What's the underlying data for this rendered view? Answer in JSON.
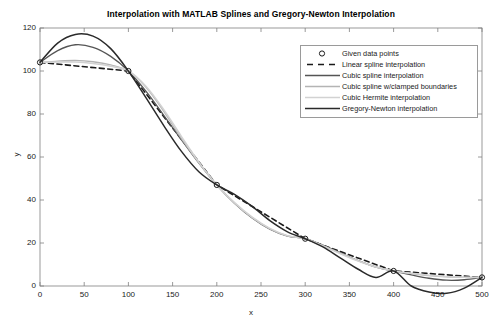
{
  "chart_data": {
    "type": "line",
    "title": "Interpolation with MATLAB Splines and Gregory-Newton Interpolation",
    "xlabel": "x",
    "ylabel": "y",
    "xlim": [
      0,
      500
    ],
    "ylim": [
      0,
      120
    ],
    "xticks": [
      0,
      50,
      100,
      150,
      200,
      250,
      300,
      350,
      400,
      450,
      500
    ],
    "yticks": [
      0,
      20,
      40,
      60,
      80,
      100,
      120
    ],
    "grid": false,
    "legend_position": "upper right",
    "given_points": {
      "x": [
        0,
        100,
        200,
        300,
        400,
        500
      ],
      "y": [
        104,
        100,
        47,
        22,
        7,
        4
      ]
    },
    "series": [
      {
        "name": "Given data points",
        "marker": "circle",
        "style": "markers",
        "color": "#1a1a1a",
        "x": [
          0,
          100,
          200,
          300,
          400,
          500
        ],
        "y": [
          104,
          100,
          47,
          22,
          7,
          4
        ]
      },
      {
        "name": "Linear spline interpolation",
        "style": "dashed",
        "color": "#1a1a1a",
        "width": 1.6,
        "x": [
          0,
          100,
          200,
          300,
          400,
          500
        ],
        "y": [
          104,
          100,
          47,
          22,
          7,
          4
        ]
      },
      {
        "name": "Cubic spline interpolation",
        "style": "solid",
        "color": "#555555",
        "width": 1.3,
        "x": [
          0,
          20,
          40,
          60,
          80,
          100,
          120,
          140,
          160,
          180,
          200,
          220,
          240,
          260,
          280,
          300,
          320,
          340,
          360,
          380,
          400,
          420,
          440,
          460,
          480,
          500
        ],
        "y": [
          104,
          109.5,
          112.2,
          111.0,
          106.8,
          100,
          90.5,
          79.4,
          68.0,
          57.0,
          47,
          38.5,
          31.6,
          26.4,
          23.2,
          22,
          19.0,
          15.4,
          11.8,
          8.8,
          7,
          5.2,
          3.6,
          2.7,
          2.9,
          4
        ]
      },
      {
        "name": "Cubic spline w/clamped boundaries",
        "style": "solid",
        "color": "#b4b4b4",
        "width": 1.3,
        "x": [
          0,
          20,
          40,
          60,
          80,
          100,
          120,
          140,
          160,
          180,
          200,
          220,
          240,
          260,
          280,
          300,
          320,
          340,
          360,
          380,
          400,
          420,
          440,
          460,
          480,
          500
        ],
        "y": [
          104,
          104.6,
          104.9,
          104.3,
          102.8,
          100,
          92.4,
          81.2,
          68.6,
          57.2,
          47,
          38.6,
          31.8,
          26.6,
          23.3,
          22,
          18.8,
          15.2,
          11.8,
          8.9,
          7,
          5.8,
          4.8,
          4.2,
          4.0,
          4
        ]
      },
      {
        "name": "Cubic Hermite interpolation",
        "style": "solid",
        "color": "#d2d2d2",
        "width": 1.6,
        "x": [
          0,
          20,
          40,
          60,
          80,
          100,
          120,
          140,
          160,
          180,
          200,
          220,
          240,
          260,
          280,
          300,
          320,
          340,
          360,
          380,
          400,
          420,
          440,
          460,
          480,
          500
        ],
        "y": [
          104,
          104.2,
          104.2,
          103.5,
          102.2,
          100,
          92.8,
          82.0,
          69.5,
          57.4,
          47,
          38.8,
          32.0,
          26.8,
          23.4,
          22,
          18.6,
          15.0,
          11.6,
          8.8,
          7,
          5.9,
          5.0,
          4.4,
          4.1,
          4
        ]
      },
      {
        "name": "Gregory-Newton interpolation",
        "style": "solid",
        "color": "#2a2a2a",
        "width": 1.5,
        "x": [
          0,
          20,
          40,
          60,
          80,
          100,
          120,
          140,
          160,
          180,
          200,
          220,
          240,
          260,
          280,
          300,
          320,
          340,
          360,
          380,
          400,
          420,
          440,
          460,
          480,
          500
        ],
        "y": [
          104,
          113.0,
          117.0,
          116.2,
          110.4,
          100,
          87.5,
          74.6,
          62.6,
          53.0,
          47,
          42.6,
          37.0,
          30.4,
          25.2,
          22,
          18.2,
          13.0,
          7.8,
          4.0,
          7,
          0.0,
          -2.8,
          -3.4,
          -1.0,
          4
        ]
      }
    ]
  },
  "legend": {
    "items": [
      {
        "label": "Given data points",
        "swatch": "marker-circle"
      },
      {
        "label": "Linear spline interpolation",
        "swatch": "line-dashed-dark"
      },
      {
        "label": "Cubic spline interpolation",
        "swatch": "line-solid-gray"
      },
      {
        "label": "Cubic spline w/clamped boundaries",
        "swatch": "line-solid-lightgray"
      },
      {
        "label": "Cubic Hermite interpolation",
        "swatch": "line-solid-lightergray"
      },
      {
        "label": "Gregory-Newton interpolation",
        "swatch": "line-solid-dark"
      }
    ]
  },
  "axes": {
    "xtick_labels": [
      "0",
      "50",
      "100",
      "150",
      "200",
      "250",
      "300",
      "350",
      "400",
      "450",
      "500"
    ],
    "ytick_labels": [
      "0",
      "20",
      "40",
      "60",
      "80",
      "100",
      "120"
    ],
    "xlabel": "x",
    "ylabel": "y"
  },
  "colors": {
    "axis": "#808080",
    "text": "#1a1a1a",
    "background": "#ffffff"
  }
}
